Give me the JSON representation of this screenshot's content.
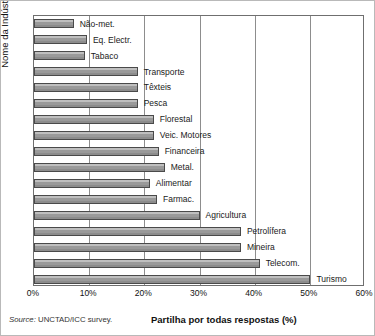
{
  "chart_data": {
    "type": "bar",
    "orientation": "horizontal",
    "title": "",
    "xlabel": "Partilha por todas respostas (%)",
    "ylabel": "Nome da Indústria",
    "xlim": [
      0,
      60
    ],
    "xticks": [
      0,
      10,
      20,
      30,
      40,
      50,
      60
    ],
    "xtick_labels": [
      "0%",
      "10%",
      "20%",
      "30%",
      "40%",
      "50%",
      "60%"
    ],
    "grid": true,
    "legend": false,
    "source_prefix": "Source:",
    "source_text": "UNCTAD/ICC survey.",
    "categories": [
      "Não-met.",
      "Eq. Electr.",
      "Tabaco",
      "Transporte",
      "Têxteis",
      "Pesca",
      "Florestal",
      "Veic. Motores",
      "Financeira",
      "Metal.",
      "Alimentar",
      "Farmac.",
      "Agricultura",
      "Petrolífera",
      "Mineira",
      "Telecom.",
      "Turismo"
    ],
    "values": [
      7.2,
      9.6,
      9.2,
      18.8,
      18.8,
      18.8,
      21.7,
      21.7,
      22.6,
      23.7,
      21.0,
      22.3,
      30.0,
      37.5,
      37.5,
      40.9,
      50.1
    ],
    "bar_color": "#9a9a9a",
    "bar_edge_color": "#4a4a4a"
  },
  "figure": {
    "frame_color": "#6f6f6f",
    "grid_color": "#8d8d8d",
    "background": "#ffffff"
  }
}
